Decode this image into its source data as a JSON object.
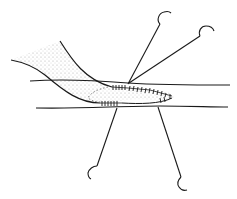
{
  "figure": {
    "colors": {
      "background": "#ffffff",
      "line": "#1a1a1a",
      "stipple": "#9a9a9a"
    },
    "elements": {
      "host_vessel": "host-vessel",
      "graft_vessel": "graft-vessel",
      "suture_line_upper": "suture-line-upper",
      "suture_line_lower": "suture-line-lower",
      "needles": [
        "needle-top-left",
        "needle-top-right",
        "needle-bottom-left",
        "needle-bottom-right"
      ]
    }
  }
}
